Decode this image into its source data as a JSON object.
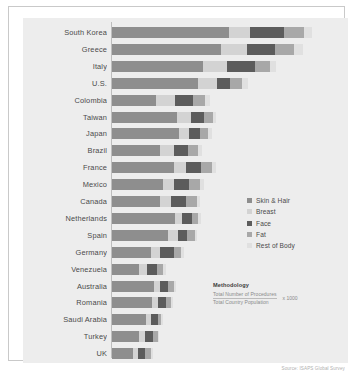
{
  "chart_data": {
    "type": "bar",
    "subtype": "stacked-horizontal-bar",
    "title": "",
    "xlabel": "",
    "ylabel": "",
    "orientation": "horizontal",
    "stacked": true,
    "grid": false,
    "legend_position": "middle-right",
    "xlim": [
      0,
      24
    ],
    "unit": "Procedures per 1,000 population",
    "categories": [
      "South Korea",
      "Greece",
      "Italy",
      "U.S.",
      "Colombia",
      "Taiwan",
      "Japan",
      "Brazil",
      "France",
      "Mexico",
      "Canada",
      "Netherlands",
      "Spain",
      "Germany",
      "Venezuela",
      "Australia",
      "Romania",
      "Saudi Arabia",
      "Turkey",
      "UK"
    ],
    "series": [
      {
        "name": "Skin & Hair",
        "color": "#8e8e8e",
        "values": [
          12.3,
          11.5,
          9.6,
          9.0,
          4.6,
          6.8,
          7.0,
          5.0,
          6.5,
          5.4,
          5.0,
          6.6,
          5.9,
          4.1,
          2.8,
          4.4,
          4.2,
          3.6,
          2.8,
          2.2
        ]
      },
      {
        "name": "Breast",
        "color": "#d3d3d3",
        "values": [
          2.2,
          2.7,
          2.5,
          2.0,
          2.0,
          1.5,
          1.1,
          1.5,
          1.3,
          1.1,
          1.2,
          0.8,
          1.0,
          1.0,
          0.9,
          0.7,
          0.6,
          0.5,
          0.7,
          0.5
        ]
      },
      {
        "name": "Face",
        "color": "#5c5c5c",
        "values": [
          3.6,
          3.0,
          3.0,
          1.4,
          1.9,
          1.4,
          1.2,
          1.5,
          1.6,
          1.6,
          1.6,
          1.0,
          1.0,
          1.4,
          1.0,
          0.8,
          0.9,
          0.7,
          0.8,
          0.8
        ]
      },
      {
        "name": "Fat",
        "color": "#a8a8a8",
        "values": [
          2.1,
          2.0,
          1.5,
          1.3,
          1.3,
          0.9,
          0.8,
          1.1,
          1.1,
          1.2,
          1.2,
          0.7,
          0.8,
          0.8,
          0.7,
          0.6,
          0.5,
          0.4,
          0.5,
          0.6
        ]
      },
      {
        "name": "Rest of Body",
        "color": "#e0e0e0",
        "values": [
          0.9,
          0.9,
          0.7,
          0.6,
          0.5,
          0.4,
          0.4,
          0.4,
          0.4,
          0.4,
          0.3,
          0.3,
          0.3,
          0.3,
          0.3,
          0.2,
          0.2,
          0.2,
          0.2,
          0.2
        ]
      }
    ],
    "totals": [
      21.1,
      20.1,
      17.3,
      14.3,
      10.3,
      11.0,
      10.5,
      9.5,
      10.9,
      9.7,
      9.3,
      9.4,
      9.0,
      7.6,
      5.7,
      6.7,
      6.4,
      5.4,
      5.0,
      4.3
    ]
  },
  "legend": {
    "items": [
      {
        "label": "Skin & Hair",
        "color": "#8e8e8e"
      },
      {
        "label": "Breast",
        "color": "#d3d3d3"
      },
      {
        "label": "Face",
        "color": "#5c5c5c"
      },
      {
        "label": "Fat",
        "color": "#a8a8a8"
      },
      {
        "label": "Rest of Body",
        "color": "#e0e0e0"
      }
    ]
  },
  "methodology": {
    "title": "Methodology",
    "numerator": "Total Number of Procedures",
    "denominator": "Total Country Population",
    "multiplier": "x 1000"
  },
  "source": {
    "text": "Source: ISAPS Global Survey"
  },
  "colors": {
    "panel_background": "#ededed",
    "page_background": "#ffffff",
    "frame_border": "#c9c9c9",
    "axis_line": "#bdbdbd",
    "label_text": "#4a4a4a"
  }
}
